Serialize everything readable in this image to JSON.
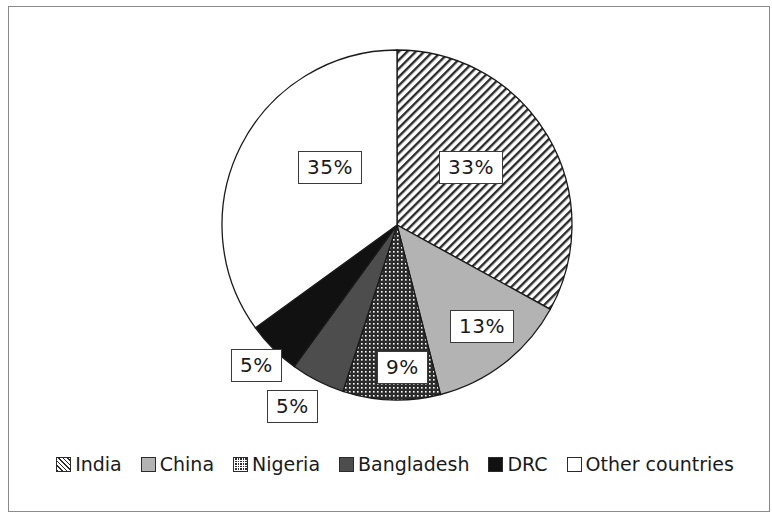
{
  "chart_data": {
    "type": "pie",
    "title": "",
    "subtitle": "",
    "xlabel": "",
    "ylabel": "",
    "legend_position": "bottom",
    "grid": false,
    "start_angle_clock": "12 o'clock",
    "direction": "clockwise",
    "categories": [
      "India",
      "China",
      "Nigeria",
      "Bangladesh",
      "DRC",
      "Other countries"
    ],
    "values": [
      33,
      13,
      9,
      5,
      5,
      35
    ],
    "value_unit": "%",
    "slices": [
      {
        "label": "India",
        "value": 33,
        "value_text": "33%",
        "fill": "diagonal-hatch",
        "fill_color": "#2b2b2b",
        "legend_swatch": "diagonal-hatch-swatch"
      },
      {
        "label": "China",
        "value": 13,
        "value_text": "13%",
        "fill": "solid",
        "fill_color": "#b3b3b3",
        "legend_swatch": "light-gray-swatch"
      },
      {
        "label": "Nigeria",
        "value": 9,
        "value_text": "9%",
        "fill": "dense-dot-grid",
        "fill_color": "#2b2b2b",
        "legend_swatch": "dotted-swatch"
      },
      {
        "label": "Bangladesh",
        "value": 5,
        "value_text": "5%",
        "fill": "solid",
        "fill_color": "#4d4d4d",
        "legend_swatch": "dark-gray-swatch"
      },
      {
        "label": "DRC",
        "value": 5,
        "value_text": "5%",
        "fill": "solid",
        "fill_color": "#111111",
        "legend_swatch": "black-swatch"
      },
      {
        "label": "Other countries",
        "value": 35,
        "value_text": "35%",
        "fill": "solid",
        "fill_color": "#ffffff",
        "legend_swatch": "white-swatch"
      }
    ]
  },
  "labels": {
    "india": "33%",
    "china": "13%",
    "nigeria": "9%",
    "bangladesh": "5%",
    "drc": "5%",
    "other": "35%"
  },
  "legend": {
    "items": [
      {
        "label": "India"
      },
      {
        "label": "China"
      },
      {
        "label": "Nigeria"
      },
      {
        "label": "Bangladesh"
      },
      {
        "label": "DRC"
      },
      {
        "label": "Other countries"
      }
    ]
  },
  "colors": {
    "frame_border": "#8a8a8a",
    "slice_outline": "#1a1a1a",
    "label_border": "#3a3a3a",
    "background": "#ffffff",
    "text": "#1a1a1a"
  }
}
